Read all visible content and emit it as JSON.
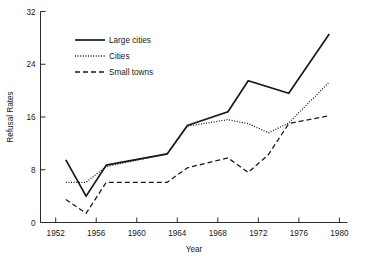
{
  "chart_data": {
    "type": "line",
    "title": "",
    "xlabel": "Year",
    "ylabel": "Refusal Rates",
    "xlim": [
      1950.5,
      1980.8
    ],
    "ylim": [
      0,
      32
    ],
    "xticks": [
      1952,
      1956,
      1960,
      1964,
      1968,
      1972,
      1976,
      1980
    ],
    "xtick_labels": [
      "1952",
      "1956",
      "1960",
      "1964",
      "1968",
      "1972",
      "1976",
      "1980"
    ],
    "yticks": [
      0,
      8,
      16,
      24,
      32
    ],
    "ytick_labels": [
      "0",
      "8",
      "16",
      "24",
      "32"
    ],
    "grid": false,
    "legend_position": "upper left",
    "series": [
      {
        "name": "Large cities",
        "style": "solid",
        "x": [
          1953,
          1955,
          1957,
          1963,
          1965,
          1969,
          1971,
          1975,
          1979
        ],
        "values": [
          9.5,
          4.0,
          8.7,
          10.4,
          14.7,
          16.8,
          21.5,
          19.6,
          28.6
        ]
      },
      {
        "name": "Cities",
        "style": "dotted",
        "x": [
          1953,
          1955,
          1957,
          1963,
          1965,
          1969,
          1971,
          1973,
          1975,
          1979
        ],
        "values": [
          6.1,
          6.1,
          8.5,
          10.4,
          14.6,
          15.6,
          15.0,
          13.6,
          15.1,
          21.3
        ]
      },
      {
        "name": "Small towns",
        "style": "dashed",
        "x": [
          1953,
          1955,
          1957,
          1963,
          1965,
          1969,
          1971,
          1973,
          1975,
          1979
        ],
        "values": [
          3.5,
          1.4,
          6.1,
          6.1,
          8.3,
          9.8,
          7.6,
          10.3,
          15.0,
          16.2
        ]
      }
    ]
  },
  "legend": {
    "entries": [
      {
        "label": "Large cities",
        "style": "solid"
      },
      {
        "label": "Cities",
        "style": "dotted"
      },
      {
        "label": "Small towns",
        "style": "dashed"
      }
    ]
  },
  "colors": {
    "ink": "#1a1a1a",
    "axis": "#2b2b2b",
    "background": "#ffffff"
  }
}
